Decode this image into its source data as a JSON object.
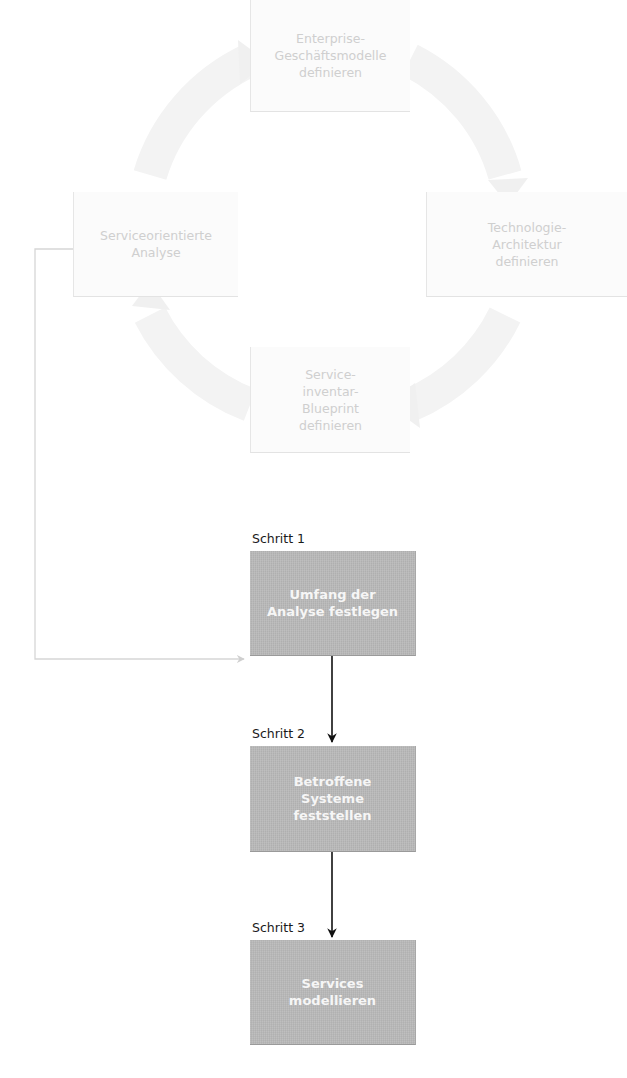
{
  "diagram": {
    "type": "process-flow",
    "cycle": {
      "description": "faded circular lifecycle of four phases",
      "nodes": [
        {
          "id": "top",
          "label": "Enterprise-\nGeschäftsmodelle\ndefinieren"
        },
        {
          "id": "right",
          "label": "Technologie-\nArchitektur\ndefinieren"
        },
        {
          "id": "bottom",
          "label": "Service-\ninventar-\nBlueprint\ndefinieren"
        },
        {
          "id": "left",
          "label": "Serviceorientierte\nAnalyse"
        }
      ],
      "arrow_direction": "clockwise",
      "color": "#f2f2f2"
    },
    "steps": [
      {
        "step_label": "Schritt 1",
        "label": "Umfang der\nAnalyse festlegen"
      },
      {
        "step_label": "Schritt 2",
        "label": "Betroffene\nSysteme\nfeststellen"
      },
      {
        "step_label": "Schritt 3",
        "label": "Services\nmodellieren"
      }
    ],
    "connectors": [
      {
        "from": "Serviceorientierte Analyse",
        "to": "Schritt 1",
        "style": "light-gray elbow arrow"
      },
      {
        "from": "Schritt 1",
        "to": "Schritt 2",
        "style": "black arrow"
      },
      {
        "from": "Schritt 2",
        "to": "Schritt 3",
        "style": "black arrow"
      }
    ],
    "colors": {
      "step_box": "#b9b9b9",
      "step_text": "#f6f6f6",
      "faded_text": "#cfcfcf",
      "arrow_dark": "#111111",
      "arrow_light": "#d4d4d4"
    }
  },
  "caption": {
    "text": ""
  }
}
